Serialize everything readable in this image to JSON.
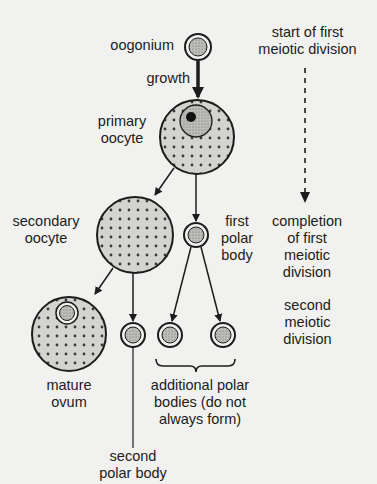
{
  "diagram": {
    "type": "oogenesis flow diagram",
    "colors": {
      "background": "#f1f1ef",
      "cell_fill": "#d3d3d0",
      "stroke": "#1c1c1c",
      "nucleolus": "#111111"
    },
    "labels": {
      "oogonium": "oogonium",
      "growth": "growth",
      "primary_oocyte_1": "primary",
      "primary_oocyte_2": "oocyte",
      "secondary_oocyte_1": "secondary",
      "secondary_oocyte_2": "oocyte",
      "first_polar_1": "first",
      "first_polar_2": "polar",
      "first_polar_3": "body",
      "mature_ovum_1": "mature",
      "mature_ovum_2": "ovum",
      "additional_1": "additional polar",
      "additional_2": "bodies (do not",
      "additional_3": "always form)",
      "second_polar_1": "second",
      "second_polar_2": "polar body",
      "start_1": "start of first",
      "start_2": "meiotic division",
      "completion_1": "completion",
      "completion_2": "of first",
      "completion_3": "meiotic",
      "completion_4": "division",
      "second_div_1": "second",
      "second_div_2": "meiotic",
      "second_div_3": "division"
    },
    "nodes": [
      "oogonium",
      "primary oocyte",
      "secondary oocyte",
      "first polar body",
      "mature ovum",
      "second polar body",
      "additional polar body",
      "additional polar body"
    ],
    "edges": [
      [
        "oogonium",
        "primary oocyte",
        "growth"
      ],
      [
        "primary oocyte",
        "secondary oocyte"
      ],
      [
        "primary oocyte",
        "first polar body"
      ],
      [
        "secondary oocyte",
        "mature ovum"
      ],
      [
        "secondary oocyte",
        "second polar body"
      ],
      [
        "first polar body",
        "additional polar body"
      ],
      [
        "first polar body",
        "additional polar body"
      ]
    ]
  }
}
